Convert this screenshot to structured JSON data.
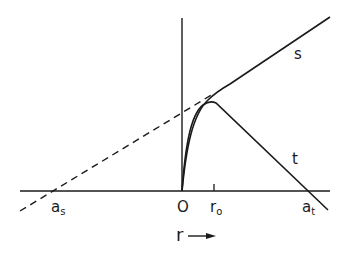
{
  "diagram": {
    "colors": {
      "line": "#1a1a1a",
      "background": "#ffffff"
    },
    "curves": [
      {
        "id": "s",
        "label": "s",
        "style": "solid",
        "description": "rises from origin, bends into straight asymptote"
      },
      {
        "id": "t",
        "label": "t",
        "style": "solid",
        "description": "rises from origin, peaks near r0, falls linearly crossing axis at a_t"
      },
      {
        "id": "s-extrapolation",
        "style": "dashed",
        "description": "straight-line extrapolation of s asymptote to axis at a_s"
      }
    ],
    "axis_labels": {
      "origin": "O",
      "r0_main": "r",
      "r0_sub": "o",
      "as_main": "a",
      "as_sub": "s",
      "at_main": "a",
      "at_sub": "t",
      "x_axis": "r",
      "x_arrow": "⟶"
    },
    "curve_labels": {
      "s": "s",
      "t": "t"
    }
  }
}
